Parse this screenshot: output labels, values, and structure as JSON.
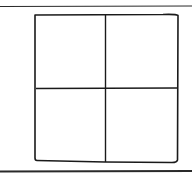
{
  "diagram": {
    "type": "hand-drawn 2x2 grid",
    "rows": 2,
    "cols": 2,
    "stroke_color": "#1a1a1a",
    "background_color": "#ffffff",
    "frame": {
      "top_rule_y": 6,
      "bottom_rule_y": 171
    },
    "square": {
      "left": 34,
      "top": 14,
      "right": 178,
      "bottom": 162,
      "vertical_divider_x": 105,
      "horizontal_divider_y": 88
    },
    "cells": [
      {
        "name": "top-left",
        "label": ""
      },
      {
        "name": "top-right",
        "label": ""
      },
      {
        "name": "bottom-left",
        "label": ""
      },
      {
        "name": "bottom-right",
        "label": ""
      }
    ]
  }
}
